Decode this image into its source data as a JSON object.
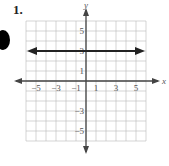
{
  "problem_number": "1.",
  "chart_data": {
    "type": "line",
    "title": "",
    "xlabel": "x",
    "ylabel": "y",
    "xlim": [
      -6,
      6
    ],
    "ylim": [
      -6,
      6
    ],
    "grid": true,
    "x_tick_labels": [
      "-5",
      "-3",
      "-1",
      "1",
      "3",
      "5"
    ],
    "y_tick_labels": [
      "5",
      "3",
      "1",
      "-3",
      "-5"
    ],
    "series": [
      {
        "name": "y = 3",
        "equation": "y = 3",
        "x": [
          -5.7,
          5.7
        ],
        "y": [
          3,
          3
        ],
        "arrows": "both"
      }
    ]
  }
}
